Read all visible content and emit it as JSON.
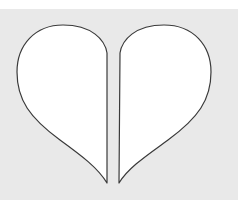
{
  "image": {
    "subject": "Heart shape split into two halves",
    "colors": {
      "background": "#e9e9e9",
      "top_strip": "#ffffff",
      "fill": "#ffffff",
      "outline": "#3a3a3a"
    },
    "pieces": [
      {
        "name": "left-half"
      },
      {
        "name": "right-half"
      }
    ]
  }
}
